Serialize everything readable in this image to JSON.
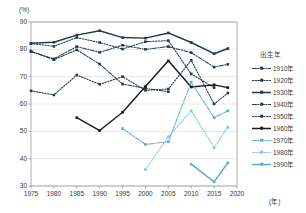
{
  "chart_data": {
    "type": "line",
    "title": "",
    "xlabel": "(年)",
    "ylabel": "(%)",
    "xlim": [
      1975,
      2020
    ],
    "ylim": [
      30,
      90
    ],
    "xticks": [
      1975,
      1980,
      1985,
      1990,
      1995,
      2000,
      2005,
      2010,
      2015,
      2020
    ],
    "yticks": [
      30,
      40,
      50,
      60,
      70,
      80,
      90
    ],
    "grid": true,
    "legend_position": "right",
    "legend_title": "出生年",
    "x": [
      1975,
      1980,
      1985,
      1990,
      1995,
      2000,
      2005,
      2010,
      2015,
      2018
    ],
    "series": [
      {
        "name": "1910年",
        "color": "#22384f",
        "style": "dashdot",
        "marker": "square",
        "x": [
          1975,
          1980,
          1985,
          1990,
          1995,
          2000,
          2005
        ],
        "values": [
          79.3,
          76.2,
          79.8,
          74.6,
          67.3,
          65.7,
          64.5
        ]
      },
      {
        "name": "1920年",
        "color": "#22384f",
        "style": "dotted",
        "marker": "square",
        "x": [
          1975,
          1980,
          1985,
          1990,
          1995,
          2000,
          2005,
          2010,
          2015
        ],
        "values": [
          82.1,
          81.1,
          84.3,
          82.5,
          80.1,
          82.8,
          83.2,
          71.0,
          66.0
        ]
      },
      {
        "name": "1930年",
        "color": "#22384f",
        "style": "solid",
        "marker": "square",
        "x": [
          1975,
          1980,
          1985,
          1990,
          1995,
          2000,
          2005,
          2010,
          2015,
          2018
        ],
        "values": [
          82.2,
          82.6,
          85.2,
          86.8,
          84.3,
          84.1,
          86.0,
          82.5,
          78.4,
          80.3
        ]
      },
      {
        "name": "1940年",
        "color": "#22384f",
        "style": "dashdot",
        "marker": "square",
        "x": [
          1975,
          1980,
          1985,
          1990,
          1995,
          2000,
          2005,
          2010,
          2015,
          2018
        ],
        "values": [
          79.2,
          76.5,
          81.0,
          78.9,
          81.5,
          80.0,
          81.0,
          78.8,
          73.5,
          74.5
        ]
      },
      {
        "name": "1950年",
        "color": "#22384f",
        "style": "dotted",
        "marker": "square",
        "x": [
          1975,
          1980,
          1985,
          1990,
          1995,
          2000,
          2005,
          2010,
          2015,
          2018
        ],
        "values": [
          64.8,
          63.3,
          70.6,
          67.2,
          70.0,
          65.0,
          65.5,
          76.0,
          60.0,
          64.0
        ]
      },
      {
        "name": "1960年",
        "color": "#1a1a1a",
        "style": "solid",
        "marker": "square",
        "x": [
          1985,
          1990,
          1995,
          2000,
          2005,
          2010,
          2015,
          2018
        ],
        "values": [
          55.0,
          50.3,
          57.0,
          66.4,
          75.8,
          66.2,
          67.0,
          66.0
        ]
      },
      {
        "name": "1970年",
        "color": "#5fa8dc",
        "style": "dashdot",
        "marker": "square",
        "x": [
          1995,
          2000,
          2005,
          2010,
          2015,
          2018
        ],
        "values": [
          51.0,
          45.2,
          46.2,
          68.0,
          55.0,
          57.5
        ]
      },
      {
        "name": "1980年",
        "color": "#84c3e8",
        "style": "dotted",
        "marker": "square",
        "x": [
          2000,
          2005,
          2010,
          2015,
          2018
        ],
        "values": [
          36.0,
          48.0,
          57.5,
          44.0,
          51.5
        ]
      },
      {
        "name": "1990年",
        "color": "#5fa8dc",
        "style": "solid",
        "marker": "square",
        "x": [
          2010,
          2015,
          2018
        ],
        "values": [
          38.0,
          31.5,
          38.5
        ]
      }
    ]
  },
  "axis": {
    "y_unit": "(%)",
    "x_unit": "(年)"
  }
}
